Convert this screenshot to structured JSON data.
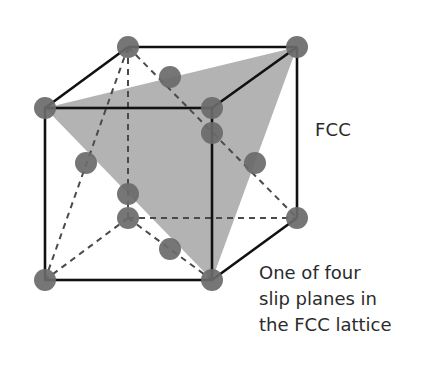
{
  "diagram": {
    "type": "fcc-unit-cell",
    "label": "FCC",
    "caption_lines": [
      "One of four",
      "slip planes in",
      "the FCC lattice"
    ],
    "colors": {
      "background": "#ffffff",
      "edge": "#111111",
      "hidden_edge": "#555555",
      "atom": "#6e6e6e",
      "slip_plane": "#b3b3b3",
      "text": "#2b2b2b"
    },
    "cube": {
      "front": {
        "tl": [
          45,
          108
        ],
        "tr": [
          212,
          108
        ],
        "bl": [
          45,
          280
        ],
        "br": [
          212,
          280
        ]
      },
      "back": {
        "tl": [
          128,
          47
        ],
        "tr": [
          297,
          47
        ],
        "bl": [
          128,
          218
        ],
        "br": [
          297,
          218
        ]
      }
    },
    "slip_plane_triangle": [
      [
        45,
        108
      ],
      [
        297,
        47
      ],
      [
        212,
        280
      ]
    ],
    "atoms": {
      "corners": [
        [
          45,
          108
        ],
        [
          212,
          108
        ],
        [
          45,
          280
        ],
        [
          212,
          280
        ],
        [
          128,
          47
        ],
        [
          297,
          47
        ],
        [
          128,
          218
        ],
        [
          297,
          218
        ]
      ],
      "face_centers": [
        [
          128,
          194
        ],
        [
          212,
          133
        ],
        [
          170,
          77
        ],
        [
          170,
          249
        ],
        [
          86,
          163
        ],
        [
          255,
          163
        ]
      ]
    }
  }
}
